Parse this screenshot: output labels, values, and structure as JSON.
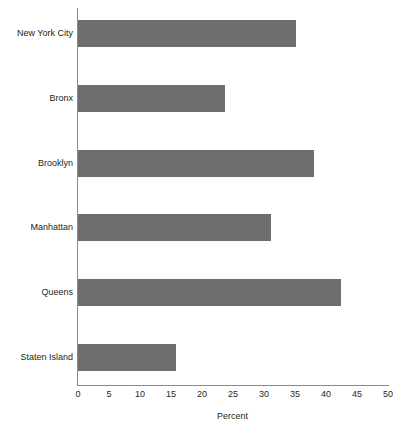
{
  "chart_data": {
    "type": "bar",
    "orientation": "horizontal",
    "title": "",
    "subtitle": "",
    "xlabel": "Percent",
    "ylabel": "",
    "categories": [
      "New York City",
      "Bronx",
      "Brooklyn",
      "Manhattan",
      "Queens",
      "Staten Island"
    ],
    "values": [
      35.2,
      23.7,
      38.0,
      31.1,
      42.4,
      15.8
    ],
    "series": [
      {
        "name": "Percent",
        "values": [
          35.2,
          23.7,
          38.0,
          31.1,
          42.4,
          15.8
        ]
      }
    ],
    "xlim": [
      0,
      50
    ],
    "xticks": [
      0,
      5,
      10,
      15,
      20,
      25,
      30,
      35,
      40,
      45,
      50
    ],
    "xtick_labels": [
      "0",
      "5",
      "10",
      "15",
      "20",
      "25",
      "30",
      "35",
      "40",
      "45",
      "50"
    ],
    "grid": false,
    "legend": null,
    "legend_position": "none",
    "bar_color": "#6e6e6e",
    "axis_color": "#8a8a8a",
    "text_color": "#231f20",
    "background_color": "#ffffff",
    "annotations": []
  }
}
